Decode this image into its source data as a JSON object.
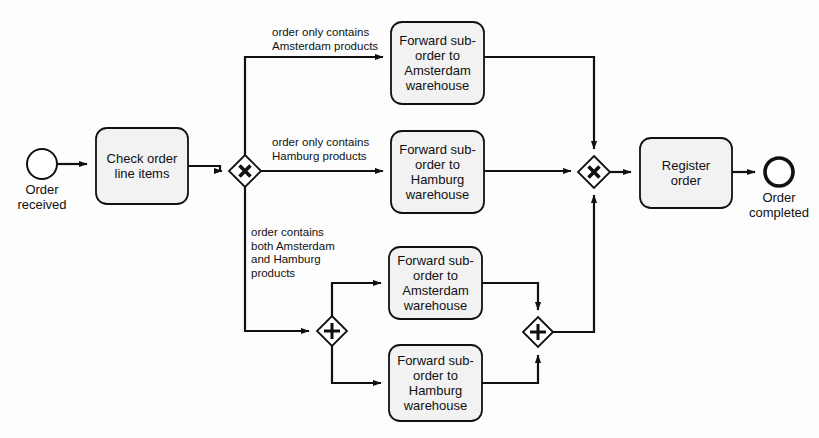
{
  "diagram": {
    "type": "bpmn-process",
    "background_color": "#fdfdfd",
    "shape_fill": "#f2f2f2",
    "stroke_color": "#111111"
  },
  "events": {
    "start": {
      "name": "start-event",
      "label": "Order\nreceived",
      "shape": "circle-thin",
      "cx": 42,
      "cy": 164,
      "r": 15
    },
    "end": {
      "name": "end-event",
      "label": "Order\ncompleted",
      "shape": "circle-thick",
      "cx": 779,
      "cy": 172,
      "r": 15
    }
  },
  "tasks": [
    {
      "id": "check-order-line-items",
      "label": "Check order\nline items",
      "x": 96,
      "y": 128,
      "w": 92,
      "h": 76
    },
    {
      "id": "forward-amsterdam-exclusive",
      "label": "Forward sub-\norder to\nAmsterdam\nwarehouse",
      "x": 391,
      "y": 22,
      "w": 93,
      "h": 82
    },
    {
      "id": "forward-hamburg-exclusive",
      "label": "Forward sub-\norder to\nHamburg\nwarehouse",
      "x": 391,
      "y": 131,
      "w": 93,
      "h": 82
    },
    {
      "id": "forward-amsterdam-parallel",
      "label": "Forward sub-\norder to\nAmsterdam\nwarehouse",
      "x": 389,
      "y": 247,
      "w": 93,
      "h": 72
    },
    {
      "id": "forward-hamburg-parallel",
      "label": "Forward sub-\norder to\nHamburg\nwarehouse",
      "x": 389,
      "y": 345,
      "w": 93,
      "h": 76
    },
    {
      "id": "register-order",
      "label": "Register\norder",
      "x": 640,
      "y": 138,
      "w": 92,
      "h": 70
    }
  ],
  "gateways": [
    {
      "id": "exclusive-split",
      "kind": "exclusive",
      "symbol": "X",
      "cx": 245,
      "cy": 171,
      "half": 16
    },
    {
      "id": "exclusive-merge",
      "kind": "exclusive",
      "symbol": "X",
      "cx": 594,
      "cy": 172,
      "half": 16
    },
    {
      "id": "parallel-split",
      "kind": "parallel",
      "symbol": "+",
      "cx": 332,
      "cy": 331,
      "half": 15
    },
    {
      "id": "parallel-join",
      "kind": "parallel",
      "symbol": "+",
      "cx": 538,
      "cy": 332,
      "half": 15
    }
  ],
  "flow_labels": [
    {
      "id": "condition-amsterdam-only",
      "text": "order only contains\nAmsterdam products",
      "x": 272,
      "y": 26
    },
    {
      "id": "condition-hamburg-only",
      "text": "order only contains\nHamburg products",
      "x": 272,
      "y": 136
    },
    {
      "id": "condition-both-cities",
      "text": "order contains\nboth Amsterdam\nand Hamburg\nproducts",
      "x": 251,
      "y": 226
    }
  ],
  "connections": [
    {
      "id": "start-to-check",
      "from": "start-event",
      "to": "check-order-line-items"
    },
    {
      "id": "check-to-split",
      "from": "check-order-line-items",
      "to": "exclusive-split"
    },
    {
      "id": "split-to-amsterdam",
      "from": "exclusive-split",
      "to": "forward-amsterdam-exclusive"
    },
    {
      "id": "split-to-hamburg",
      "from": "exclusive-split",
      "to": "forward-hamburg-exclusive"
    },
    {
      "id": "split-to-parallel-split",
      "from": "exclusive-split",
      "to": "parallel-split"
    },
    {
      "id": "amsterdam-to-merge",
      "from": "forward-amsterdam-exclusive",
      "to": "exclusive-merge"
    },
    {
      "id": "hamburg-to-merge",
      "from": "forward-hamburg-exclusive",
      "to": "exclusive-merge"
    },
    {
      "id": "parallel-split-to-amsterdam",
      "from": "parallel-split",
      "to": "forward-amsterdam-parallel"
    },
    {
      "id": "parallel-split-to-hamburg",
      "from": "parallel-split",
      "to": "forward-hamburg-parallel"
    },
    {
      "id": "amsterdam-to-join",
      "from": "forward-amsterdam-parallel",
      "to": "parallel-join"
    },
    {
      "id": "hamburg-to-join",
      "from": "forward-hamburg-parallel",
      "to": "parallel-join"
    },
    {
      "id": "join-to-merge",
      "from": "parallel-join",
      "to": "exclusive-merge"
    },
    {
      "id": "merge-to-register",
      "from": "exclusive-merge",
      "to": "register-order"
    },
    {
      "id": "register-to-end",
      "from": "register-order",
      "to": "end-event"
    }
  ]
}
